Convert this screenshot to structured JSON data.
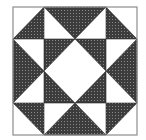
{
  "diagram": {
    "colors": {
      "background": "#ffffff",
      "fabric_dark": "#3c3c3c",
      "fabric_dot": "#8a8a8a",
      "seam": "#2a2a2a",
      "border": "#8c8c8c"
    }
  }
}
